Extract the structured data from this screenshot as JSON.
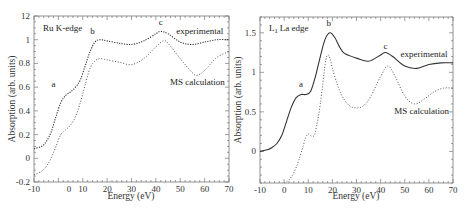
{
  "chart_data": [
    {
      "type": "line",
      "title": "Ru K-edge",
      "xlabel": "Energy (eV)",
      "ylabel": "Absorption (arb. units)",
      "xlim": [
        -10,
        70
      ],
      "ylim": [
        -0.2,
        1.2
      ],
      "x_ticks": [
        "-10",
        "0",
        "10",
        "20",
        "30",
        "40",
        "50",
        "60",
        "70"
      ],
      "y_ticks": [
        "-0.2",
        "0",
        "0.2",
        "0.4",
        "0.6",
        "0.8",
        "1",
        "12"
      ],
      "grid": false,
      "annotations": [
        {
          "text": "a",
          "x": -2,
          "y": 0.6
        },
        {
          "text": "b",
          "x": 14,
          "y": 1.05
        },
        {
          "text": "c",
          "x": 42,
          "y": 1.12
        },
        {
          "text": "experimental",
          "x": 58,
          "y": 1.05
        },
        {
          "text": "MS calculation",
          "x": 57,
          "y": 0.62
        }
      ],
      "series": [
        {
          "name": "experimental",
          "style": "dotted",
          "x": [
            -10,
            -7,
            -5,
            -3,
            -1,
            1,
            3,
            5,
            7,
            9,
            11,
            13,
            15,
            17,
            20,
            25,
            30,
            35,
            40,
            42,
            45,
            50,
            55,
            60,
            65,
            70
          ],
          "y": [
            0.08,
            0.1,
            0.14,
            0.22,
            0.35,
            0.47,
            0.53,
            0.56,
            0.6,
            0.66,
            0.78,
            0.9,
            0.98,
            1.0,
            0.99,
            0.97,
            0.96,
            0.99,
            1.05,
            1.07,
            1.05,
            0.98,
            0.96,
            0.98,
            1.0,
            1.0
          ]
        },
        {
          "name": "MS calculation",
          "style": "dotted",
          "x": [
            -10,
            -7,
            -5,
            -3,
            -1,
            1,
            3,
            5,
            7,
            9,
            11,
            13,
            15,
            17,
            20,
            25,
            30,
            35,
            40,
            43,
            45,
            50,
            55,
            57,
            60,
            65,
            70
          ],
          "y": [
            -0.14,
            -0.11,
            -0.07,
            0.0,
            0.1,
            0.2,
            0.24,
            0.28,
            0.35,
            0.47,
            0.62,
            0.76,
            0.82,
            0.84,
            0.83,
            0.81,
            0.79,
            0.84,
            0.94,
            0.99,
            0.97,
            0.84,
            0.72,
            0.7,
            0.74,
            0.85,
            0.9
          ]
        }
      ]
    },
    {
      "type": "line",
      "title": "L1 La edge",
      "xlabel": "Energy (eV)",
      "ylabel": "Absorption (arb. units)",
      "xlim": [
        -10,
        70
      ],
      "ylim": [
        -0.4,
        1.7
      ],
      "x_ticks": [
        "-10",
        "0",
        "10",
        "20",
        "30",
        "40",
        "50",
        "60",
        "70"
      ],
      "y_ticks": [
        "0",
        "0.5",
        "1",
        "1.5"
      ],
      "grid": false,
      "annotations": [
        {
          "text": "a",
          "x": 7,
          "y": 0.82
        },
        {
          "text": "b",
          "x": 18.5,
          "y": 1.58
        },
        {
          "text": "c",
          "x": 42,
          "y": 1.3
        },
        {
          "text": "experimental",
          "x": 58,
          "y": 1.2
        },
        {
          "text": "MS calculation",
          "x": 57,
          "y": 0.47
        }
      ],
      "series": [
        {
          "name": "experimental",
          "style": "solid",
          "x": [
            -10,
            -7,
            -5,
            -3,
            -1,
            1,
            3,
            5,
            7,
            9,
            11,
            13,
            15,
            17,
            19,
            21,
            23,
            25,
            30,
            35,
            40,
            42,
            45,
            50,
            55,
            60,
            65,
            70
          ],
          "y": [
            0.0,
            0.02,
            0.05,
            0.1,
            0.2,
            0.38,
            0.56,
            0.68,
            0.72,
            0.72,
            0.76,
            0.95,
            1.2,
            1.42,
            1.5,
            1.44,
            1.32,
            1.24,
            1.18,
            1.14,
            1.22,
            1.25,
            1.2,
            1.08,
            1.05,
            1.1,
            1.12,
            1.12
          ]
        },
        {
          "name": "MS calculation",
          "style": "dotted",
          "x": [
            0,
            2,
            4,
            6,
            8,
            9,
            10,
            11,
            12,
            13,
            15,
            17,
            18,
            19,
            20,
            22,
            24,
            27,
            30,
            33,
            36,
            40,
            43,
            46,
            50,
            54,
            58,
            62,
            66,
            70
          ],
          "y": [
            -0.4,
            -0.36,
            -0.27,
            -0.12,
            0.08,
            0.18,
            0.22,
            0.2,
            0.19,
            0.25,
            0.6,
            1.1,
            1.22,
            1.18,
            1.05,
            0.85,
            0.7,
            0.58,
            0.55,
            0.58,
            0.7,
            0.95,
            1.08,
            0.95,
            0.7,
            0.6,
            0.66,
            0.75,
            0.8,
            0.8
          ]
        }
      ]
    }
  ]
}
